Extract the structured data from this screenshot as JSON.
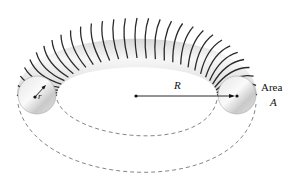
{
  "diagram": {
    "type": "toroid",
    "labels": {
      "major_radius": "R",
      "minor_radius": "r",
      "area_word": "Area",
      "area_symbol": "A"
    },
    "geometry": {
      "center": [
        136,
        96
      ],
      "left_section_center": [
        37,
        95
      ],
      "right_section_center": [
        237,
        95
      ],
      "section_radius": 20,
      "turns": 30
    },
    "colors": {
      "wire": "#2a2a2a",
      "core_light": "#f2f2f2",
      "core_dark": "#bdbdbd",
      "dashed": "#666666",
      "text": "#111111"
    }
  }
}
